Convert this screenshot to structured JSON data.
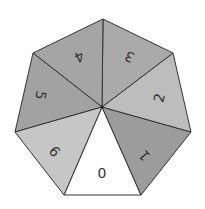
{
  "figure": {
    "type": "heptagon-divided-into-triangles",
    "center": [
      102,
      107
    ],
    "vertices": [
      [
        103,
        19
      ],
      [
        173,
        53
      ],
      [
        191,
        132
      ],
      [
        141,
        195
      ],
      [
        64,
        195
      ],
      [
        15,
        132
      ],
      [
        33,
        53
      ]
    ],
    "segments": [
      {
        "label": "0",
        "from": 3,
        "to": 4,
        "color": "#ffffff",
        "text_pos": [
          102,
          174
        ],
        "rotate": 0
      },
      {
        "label": "1",
        "from": 2,
        "to": 3,
        "color": "#9c9c9c",
        "text_pos": [
          145,
          155
        ],
        "rotate": -130
      },
      {
        "label": "2",
        "from": 1,
        "to": 2,
        "color": "#bdbdbd",
        "text_pos": [
          160,
          98
        ],
        "rotate": -77
      },
      {
        "label": "3",
        "from": 0,
        "to": 1,
        "color": "#aaaaaa",
        "text_pos": [
          130,
          56
        ],
        "rotate": -155
      },
      {
        "label": "4",
        "from": 6,
        "to": 0,
        "color": "#a5a5a5",
        "text_pos": [
          79,
          56
        ],
        "rotate": 155
      },
      {
        "label": "5",
        "from": 5,
        "to": 6,
        "color": "#a2a2a2",
        "text_pos": [
          40,
          95
        ],
        "rotate": 100
      },
      {
        "label": "6",
        "from": 4,
        "to": 5,
        "color": "#c6c6c6",
        "text_pos": [
          54,
          152
        ],
        "rotate": 50
      }
    ],
    "stroke_color": "#333333"
  }
}
